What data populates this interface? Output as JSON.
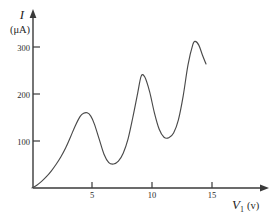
{
  "chart_data": {
    "type": "line",
    "title": "",
    "subtitle": "",
    "xlabel": "V",
    "xlabel_subscript": "1",
    "xlabel_unit": "(v)",
    "ylabel": "I",
    "ylabel_unit": "(μA)",
    "xlim": [
      0,
      16.5
    ],
    "ylim": [
      0,
      345
    ],
    "grid": false,
    "legend": "none",
    "xticks": [
      5,
      10,
      15
    ],
    "xtick_labels": [
      "5",
      "10",
      "15"
    ],
    "yticks": [
      100,
      200,
      300
    ],
    "ytick_labels": [
      "100",
      "200",
      "300"
    ],
    "series": [
      {
        "name": "anode current",
        "x": [
          0.0,
          0.4,
          0.8,
          1.2,
          1.6,
          2.0,
          2.4,
          2.8,
          3.2,
          3.6,
          4.0,
          4.3,
          4.6,
          4.9,
          5.2,
          5.6,
          6.0,
          6.4,
          6.8,
          7.2,
          7.6,
          8.0,
          8.4,
          8.8,
          9.1,
          9.4,
          9.8,
          10.2,
          10.6,
          11.0,
          11.4,
          11.8,
          12.2,
          12.6,
          13.0,
          13.4,
          13.6,
          13.9,
          14.2,
          14.5
        ],
        "y": [
          0,
          6,
          14,
          24,
          36,
          50,
          66,
          85,
          108,
          132,
          152,
          159,
          160,
          153,
          136,
          104,
          72,
          54,
          51,
          57,
          74,
          104,
          150,
          201,
          238,
          236,
          205,
          160,
          125,
          108,
          107,
          117,
          145,
          196,
          262,
          305,
          312,
          304,
          283,
          264
        ]
      }
    ],
    "annotations": []
  },
  "colors": {
    "curve": "#4a4a4a",
    "axis": "#3a3a3a",
    "text": "#2b2b2b",
    "background": "#ffffff"
  }
}
